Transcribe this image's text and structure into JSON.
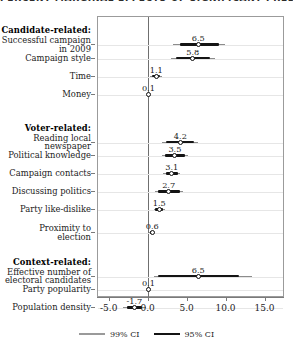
{
  "figure": {
    "title_clipped": "PERCENT MARGINAL EFFECTS OF SIGNIFICANT PREDICTORS"
  },
  "legend": {
    "items": [
      {
        "label": "99% CI",
        "color": "#9a9a9a",
        "style": "thin"
      },
      {
        "label": "95% CI",
        "color": "#141414",
        "style": "thick"
      }
    ]
  },
  "axis": {
    "ticks": [
      "-5.0",
      "0.0",
      "5.0",
      "10.0",
      "15.0"
    ],
    "tick_values": [
      -5,
      0,
      5,
      10,
      15
    ]
  },
  "chart_data": {
    "type": "scatter",
    "title": "PERCENT MARGINAL EFFECTS OF SIGNIFICANT PREDICTORS",
    "xlabel": "",
    "ylabel": "",
    "xlim": [
      -6.5,
      17.5
    ],
    "grid": true,
    "legend_position": "bottom",
    "reference_line": 0,
    "groups": [
      {
        "name": "Candidate-related:",
        "rows": [
          {
            "label": "Successful campaign\nin 2009",
            "value": 6.5,
            "value_label": "6.5",
            "ci95": [
              4.1,
              9.1
            ],
            "ci99": [
              3.3,
              9.9
            ]
          },
          {
            "label": "Campaign style",
            "value": 5.8,
            "value_label": "5.8",
            "ci95": [
              3.7,
              8.0
            ],
            "ci99": [
              3.0,
              8.7
            ]
          },
          {
            "label": "Time",
            "value": 1.1,
            "value_label": "1.1",
            "ci95": [
              0.5,
              1.6
            ],
            "ci99": [
              0.3,
              1.9
            ]
          },
          {
            "label": "Money",
            "value": 0.1,
            "value_label": "0.1",
            "ci95": [
              0.0,
              0.2
            ],
            "ci99": [
              -0.1,
              0.3
            ]
          }
        ]
      },
      {
        "name": "Voter-related:",
        "rows": [
          {
            "label": "Reading local\nnewspaper",
            "value": 4.2,
            "value_label": "4.2",
            "ci95": [
              2.4,
              5.9
            ],
            "ci99": [
              1.9,
              6.5
            ]
          },
          {
            "label": "Political knowledge",
            "value": 3.5,
            "value_label": "3.5",
            "ci95": [
              2.2,
              4.8
            ],
            "ci99": [
              1.8,
              5.2
            ]
          },
          {
            "label": "Campaign contacts",
            "value": 3.1,
            "value_label": "3.1",
            "ci95": [
              2.3,
              3.9
            ],
            "ci99": [
              2.0,
              4.2
            ]
          },
          {
            "label": "Discussing politics",
            "value": 2.7,
            "value_label": "2.7",
            "ci95": [
              1.3,
              4.1
            ],
            "ci99": [
              0.9,
              4.5
            ]
          },
          {
            "label": "Party like-dislike",
            "value": 1.5,
            "value_label": "1.5",
            "ci95": [
              1.0,
              2.0
            ],
            "ci99": [
              0.8,
              2.2
            ]
          },
          {
            "label": "Proximity to\nelection",
            "value": 0.6,
            "value_label": "0.6",
            "ci95": [
              0.3,
              0.8
            ],
            "ci99": [
              0.2,
              0.9
            ]
          }
        ]
      },
      {
        "name": "Context-related:",
        "rows": [
          {
            "label": "Effective number of\nelectoral candidates",
            "value": 6.5,
            "value_label": "6.5",
            "ci95": [
              1.3,
              11.7
            ],
            "ci99": [
              0.8,
              13.4
            ]
          },
          {
            "label": "Party popularity",
            "value": 0.1,
            "value_label": "0.1",
            "ci95": [
              0.0,
              0.2
            ],
            "ci99": [
              -0.1,
              0.3
            ]
          },
          {
            "label": "Population density",
            "value": -1.7,
            "value_label": "-1.7",
            "ci95": [
              -2.7,
              -0.7
            ],
            "ci99": [
              -3.2,
              -0.2
            ]
          }
        ]
      }
    ]
  }
}
